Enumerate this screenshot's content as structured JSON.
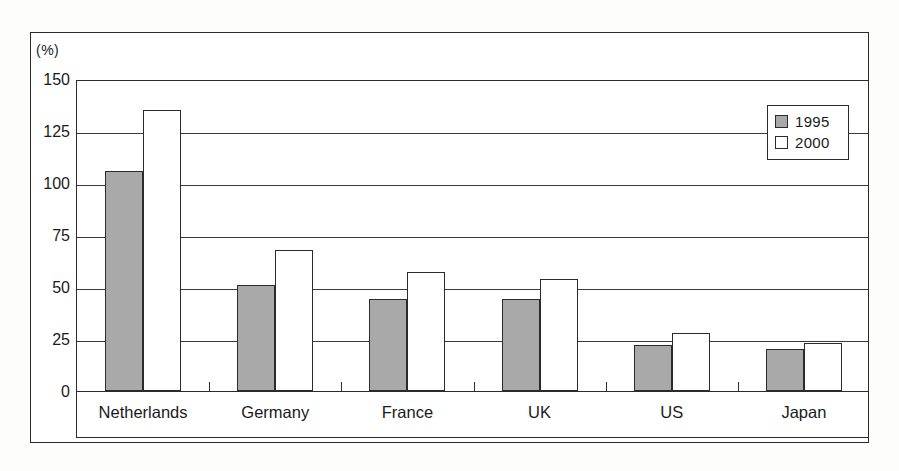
{
  "figure": {
    "unit_label": "(%)",
    "frame_color": "#2b2b2b",
    "background": "#ffffff"
  },
  "legend": {
    "position": "top-right-inside-plot",
    "entries": [
      {
        "label": "1995",
        "swatch": "gray-filled-square",
        "color": "#a9a9a9"
      },
      {
        "label": "2000",
        "swatch": "white-square",
        "color": "#ffffff"
      }
    ]
  },
  "chart_data": {
    "type": "bar",
    "title": "",
    "subtitle": "",
    "xlabel": "",
    "ylabel": "(%)",
    "categories": [
      "Netherlands",
      "Germany",
      "France",
      "UK",
      "US",
      "Japan"
    ],
    "series": [
      {
        "name": "1995",
        "color": "#a9a9a9",
        "values": [
          106,
          51,
          44,
          44,
          22,
          20
        ]
      },
      {
        "name": "2000",
        "color": "#ffffff",
        "values": [
          135,
          68,
          57,
          54,
          28,
          23
        ]
      }
    ],
    "ylim": [
      0,
      150
    ],
    "yticks": [
      0,
      25,
      50,
      75,
      100,
      125,
      150
    ],
    "ytick_labels": [
      "0",
      "25",
      "50",
      "75",
      "100",
      "125",
      "150"
    ],
    "grid": "horizontal",
    "legend_position": "upper right",
    "annotations": []
  }
}
